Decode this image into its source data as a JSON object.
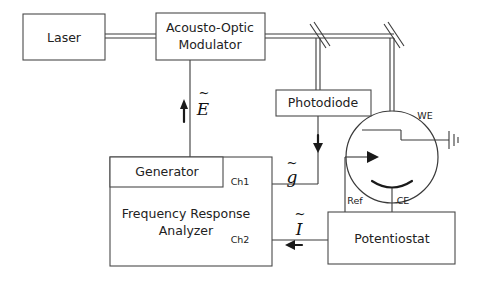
{
  "figure": {
    "type": "optical-electrochemical-setup-schematic",
    "domain": "diagram",
    "background_color": "#ffffff",
    "line_color": "#3a3a3a",
    "text_color": "#222222"
  },
  "boxes": {
    "laser": {
      "label": "Laser"
    },
    "modulator": {
      "label_line1": "Acousto-Optic",
      "label_line2": "Modulator"
    },
    "photodiode": {
      "label": "Photodiode"
    },
    "generator": {
      "label": "Generator"
    },
    "analyzer": {
      "label_line1": "Frequency Response",
      "label_line2": "Analyzer"
    },
    "potentiostat": {
      "label": "Potentiostat"
    }
  },
  "ports": {
    "ch1": "Ch1",
    "ch2": "Ch2"
  },
  "electrodes": {
    "working": "WE",
    "reference": "Ref",
    "counter": "CE"
  },
  "signals": {
    "field": {
      "symbol": "E",
      "accent": "~",
      "description": "modulation drive signal to acousto-optic modulator"
    },
    "photo": {
      "symbol": "g",
      "accent": "~",
      "description": "photodiode signal to analyzer channel 1"
    },
    "current": {
      "symbol": "I",
      "accent": "~",
      "description": "current signal from potentiostat to analyzer channel 2"
    }
  },
  "optics": {
    "beam_splitter_label": "beam-splitter",
    "mirror_label": "mirror"
  }
}
